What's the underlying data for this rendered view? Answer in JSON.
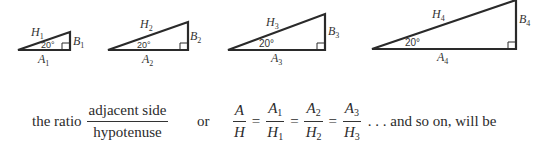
{
  "figure": {
    "angle_label": "20°",
    "triangles": [
      {
        "hyp": "H",
        "sub": "1",
        "opp": "B",
        "adj": "A",
        "points": {
          "left": [
            18,
            50
          ],
          "right": [
            70,
            50
          ],
          "top": [
            70,
            32
          ]
        }
      },
      {
        "hyp": "H",
        "sub": "2",
        "opp": "B",
        "adj": "A",
        "points": {
          "left": [
            108,
            50
          ],
          "right": [
            188,
            50
          ],
          "top": [
            188,
            22
          ]
        }
      },
      {
        "hyp": "H",
        "sub": "3",
        "opp": "B",
        "adj": "A",
        "points": {
          "left": [
            228,
            50
          ],
          "right": [
            325,
            50
          ],
          "top": [
            325,
            14
          ]
        }
      },
      {
        "hyp": "H",
        "sub": "4",
        "opp": "B",
        "adj": "A",
        "points": {
          "left": [
            372,
            49
          ],
          "right": [
            516,
            49
          ],
          "top": [
            516,
            0
          ]
        }
      }
    ]
  },
  "text": {
    "lead": "the ratio",
    "frac_num": "adjacent side",
    "frac_den": "hypotenuse",
    "or": "or",
    "A": "A",
    "H": "H",
    "eq": "=",
    "s1": "1",
    "s2": "2",
    "s3": "3",
    "tail": ". . . and so on, will be"
  }
}
